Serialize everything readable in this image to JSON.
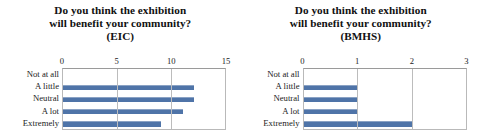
{
  "charts": [
    {
      "id": "eic",
      "title_lines": [
        "Do you think the exhibition",
        "will benefit your community?",
        "(EIC)"
      ],
      "chart_data": {
        "type": "bar",
        "orientation": "horizontal",
        "title": "Do you think the exhibition will benefit your community? (EIC)",
        "categories": [
          "Not at all",
          "A little",
          "Neutral",
          "A lot",
          "Extremely"
        ],
        "values": [
          0,
          12,
          12,
          11,
          9
        ],
        "xlabel": "",
        "ylabel": "",
        "xlim": [
          0,
          15
        ],
        "xticks": [
          "0",
          "5",
          "10",
          "15"
        ],
        "xtick_values": [
          0,
          5,
          10,
          15
        ],
        "grid": true,
        "legend": "none",
        "bar_color": "#4f74a8"
      }
    },
    {
      "id": "bmhs",
      "title_lines": [
        "Do you think the exhibition",
        "will benefit your community?",
        "(BMHS)"
      ],
      "chart_data": {
        "type": "bar",
        "orientation": "horizontal",
        "title": "Do you think the exhibition will benefit your community? (BMHS)",
        "categories": [
          "Not at all",
          "A little",
          "Neutral",
          "A lot",
          "Extremely"
        ],
        "values": [
          0,
          1,
          1,
          1,
          2
        ],
        "xlabel": "",
        "ylabel": "",
        "xlim": [
          0,
          3
        ],
        "xticks": [
          "0",
          "1",
          "2",
          "3"
        ],
        "xtick_values": [
          0,
          1,
          2,
          3
        ],
        "grid": true,
        "legend": "none",
        "bar_color": "#4f74a8"
      }
    }
  ]
}
